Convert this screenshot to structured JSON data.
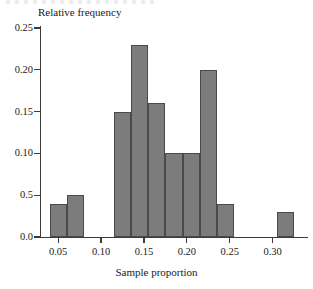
{
  "figure": {
    "width": 313,
    "height": 289,
    "background": "#ffffff",
    "bar_fill": "#7c7c7c",
    "bar_edge": "#4a4a4a",
    "axis_color": "#3b3b3b"
  },
  "chart_data": {
    "type": "bar",
    "title": "",
    "subtitle": "",
    "xlabel": "Sample proportion",
    "ylabel": "Relative frequency",
    "grid": false,
    "legend": null,
    "xlim": [
      0.03,
      0.34
    ],
    "ylim": [
      0.0,
      0.25
    ],
    "x_ticks": [
      0.05,
      0.1,
      0.15,
      0.2,
      0.25,
      0.3
    ],
    "x_tick_labels": [
      "0.05",
      "0.10",
      "0.15",
      "0.20",
      "0.25",
      "0.30"
    ],
    "y_ticks": [
      0.0,
      0.05,
      0.1,
      0.15,
      0.2,
      0.25
    ],
    "y_tick_labels": [
      "0.0",
      "0.5",
      "0.10",
      "0.15",
      "0.20",
      "0.25"
    ],
    "bin_width": 0.02,
    "categories": [
      "0.04-0.06",
      "0.06-0.08",
      "0.115-0.135",
      "0.135-0.155",
      "0.155-0.175",
      "0.175-0.195",
      "0.195-0.215",
      "0.215-0.235",
      "0.235-0.255",
      "0.305-0.325"
    ],
    "bins": [
      {
        "left": 0.04,
        "right": 0.06,
        "value": 0.04
      },
      {
        "left": 0.06,
        "right": 0.08,
        "value": 0.05
      },
      {
        "left": 0.115,
        "right": 0.135,
        "value": 0.15
      },
      {
        "left": 0.135,
        "right": 0.155,
        "value": 0.23
      },
      {
        "left": 0.155,
        "right": 0.175,
        "value": 0.16
      },
      {
        "left": 0.175,
        "right": 0.195,
        "value": 0.1
      },
      {
        "left": 0.195,
        "right": 0.215,
        "value": 0.1
      },
      {
        "left": 0.215,
        "right": 0.235,
        "value": 0.2
      },
      {
        "left": 0.235,
        "right": 0.255,
        "value": 0.04
      },
      {
        "left": 0.305,
        "right": 0.325,
        "value": 0.03
      }
    ],
    "values": [
      0.04,
      0.05,
      0.15,
      0.23,
      0.16,
      0.1,
      0.1,
      0.2,
      0.04,
      0.03
    ]
  },
  "axes": {
    "y_title": "Relative frequency",
    "x_title": "Sample proportion"
  }
}
